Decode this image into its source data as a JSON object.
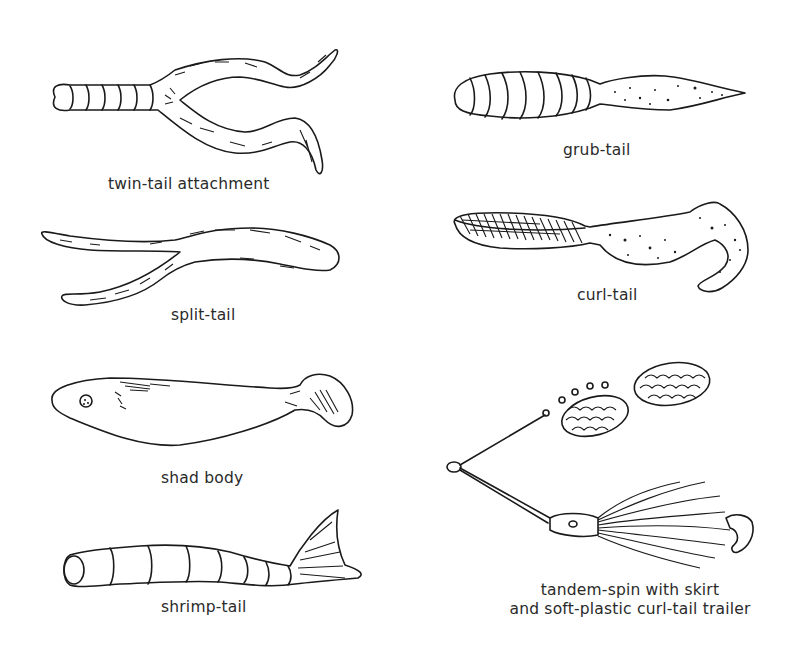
{
  "figure": {
    "background": "#ffffff",
    "ink_color": "#1a1a1a",
    "items": [
      {
        "id": "twin-tail",
        "label": "twin-tail attachment",
        "column": "left",
        "row": 1
      },
      {
        "id": "grub-tail",
        "label": "grub-tail",
        "column": "right",
        "row": 1
      },
      {
        "id": "split-tail",
        "label": "split-tail",
        "column": "left",
        "row": 2
      },
      {
        "id": "curl-tail",
        "label": "curl-tail",
        "column": "right",
        "row": 2
      },
      {
        "id": "shad-body",
        "label": "shad body",
        "column": "left",
        "row": 3
      },
      {
        "id": "shrimp-tail",
        "label": "shrimp-tail",
        "column": "left",
        "row": 4
      },
      {
        "id": "tandem-spin",
        "label_line1": "tandem-spin with skirt",
        "label_line2": "and soft-plastic curl-tail trailer",
        "column": "right",
        "row": 3
      }
    ]
  }
}
